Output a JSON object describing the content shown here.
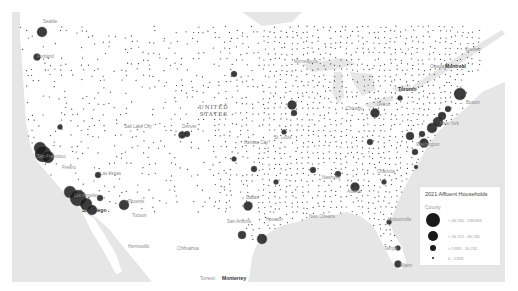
{
  "map": {
    "country_label": [
      "UNITED",
      "STATES"
    ],
    "colors": {
      "water": "#e6e6e6",
      "land": "#ffffff",
      "symbol": "#1a1a1a",
      "dot": "#3a3a3a"
    },
    "labels": [
      {
        "text": "Quebec",
        "x": 453,
        "y": 38,
        "bold": false
      },
      {
        "text": "Ottawa",
        "x": 418,
        "y": 55,
        "bold": false
      },
      {
        "text": "Montreal",
        "x": 433,
        "y": 54,
        "bold": true
      },
      {
        "text": "Toronto",
        "x": 386,
        "y": 77,
        "bold": true
      },
      {
        "text": "Boston",
        "x": 454,
        "y": 91,
        "bold": false
      },
      {
        "text": "New York",
        "x": 428,
        "y": 112,
        "bold": false
      },
      {
        "text": "Washington",
        "x": 404,
        "y": 133,
        "bold": false
      },
      {
        "text": "Chicago",
        "x": 334,
        "y": 97,
        "bold": false
      },
      {
        "text": "Detroit",
        "x": 365,
        "y": 93,
        "bold": false
      },
      {
        "text": "Minneapolis",
        "x": 282,
        "y": 50,
        "bold": false
      },
      {
        "text": "Seattle",
        "x": 31,
        "y": 10,
        "bold": false
      },
      {
        "text": "Portland",
        "x": 25,
        "y": 45,
        "bold": false
      },
      {
        "text": "Salt Lake City",
        "x": 112,
        "y": 115,
        "bold": false
      },
      {
        "text": "Denver",
        "x": 170,
        "y": 115,
        "bold": false
      },
      {
        "text": "San Francisco",
        "x": 25,
        "y": 145,
        "bold": false
      },
      {
        "text": "Fresno",
        "x": 50,
        "y": 156,
        "bold": false
      },
      {
        "text": "Las Vegas",
        "x": 88,
        "y": 162,
        "bold": false
      },
      {
        "text": "Los Angeles",
        "x": 62,
        "y": 184,
        "bold": false
      },
      {
        "text": "San Diego",
        "x": 70,
        "y": 198,
        "bold": true
      },
      {
        "text": "Phoenix",
        "x": 116,
        "y": 190,
        "bold": false
      },
      {
        "text": "Tucson",
        "x": 120,
        "y": 204,
        "bold": false
      },
      {
        "text": "Hermosillo",
        "x": 116,
        "y": 235,
        "bold": false
      },
      {
        "text": "Chihuahua",
        "x": 165,
        "y": 237,
        "bold": false
      },
      {
        "text": "Torreon",
        "x": 188,
        "y": 267,
        "bold": false
      },
      {
        "text": "Monterrey",
        "x": 210,
        "y": 266,
        "bold": true
      },
      {
        "text": "Culiacan",
        "x": 152,
        "y": 276,
        "bold": false
      },
      {
        "text": "Kansas City",
        "x": 232,
        "y": 131,
        "bold": false
      },
      {
        "text": "St. Louis",
        "x": 262,
        "y": 126,
        "bold": false
      },
      {
        "text": "Nashville",
        "x": 310,
        "y": 166,
        "bold": false
      },
      {
        "text": "Atlanta",
        "x": 335,
        "y": 180,
        "bold": false
      },
      {
        "text": "Charlotte",
        "x": 365,
        "y": 160,
        "bold": false
      },
      {
        "text": "Dallas",
        "x": 234,
        "y": 186,
        "bold": false
      },
      {
        "text": "San Antonio",
        "x": 215,
        "y": 210,
        "bold": false
      },
      {
        "text": "Houston",
        "x": 254,
        "y": 208,
        "bold": false
      },
      {
        "text": "New Orleans",
        "x": 297,
        "y": 205,
        "bold": false
      },
      {
        "text": "Jacksonville",
        "x": 375,
        "y": 208,
        "bold": false
      },
      {
        "text": "Tampa",
        "x": 372,
        "y": 237,
        "bold": false
      },
      {
        "text": "Miami",
        "x": 388,
        "y": 254,
        "bold": false
      }
    ],
    "bubbles": [
      {
        "x": 30,
        "y": 20,
        "r": 5
      },
      {
        "x": 25,
        "y": 45,
        "r": 3.5
      },
      {
        "x": 28,
        "y": 136,
        "r": 6
      },
      {
        "x": 31,
        "y": 142,
        "r": 8
      },
      {
        "x": 36,
        "y": 145,
        "r": 6
      },
      {
        "x": 86,
        "y": 163,
        "r": 3
      },
      {
        "x": 58,
        "y": 180,
        "r": 6
      },
      {
        "x": 66,
        "y": 186,
        "r": 8
      },
      {
        "x": 74,
        "y": 192,
        "r": 6
      },
      {
        "x": 80,
        "y": 198,
        "r": 5
      },
      {
        "x": 88,
        "y": 186,
        "r": 3
      },
      {
        "x": 112,
        "y": 193,
        "r": 5
      },
      {
        "x": 48,
        "y": 115,
        "r": 2.5
      },
      {
        "x": 170,
        "y": 123,
        "r": 3.5
      },
      {
        "x": 175,
        "y": 122,
        "r": 3
      },
      {
        "x": 222,
        "y": 62,
        "r": 3
      },
      {
        "x": 222,
        "y": 147,
        "r": 2.5
      },
      {
        "x": 242,
        "y": 157,
        "r": 3
      },
      {
        "x": 236,
        "y": 194,
        "r": 4.5
      },
      {
        "x": 230,
        "y": 223,
        "r": 4
      },
      {
        "x": 250,
        "y": 227,
        "r": 5
      },
      {
        "x": 272,
        "y": 120,
        "r": 2.5
      },
      {
        "x": 264,
        "y": 170,
        "r": 2.5
      },
      {
        "x": 280,
        "y": 93,
        "r": 4.5
      },
      {
        "x": 282,
        "y": 101,
        "r": 3
      },
      {
        "x": 301,
        "y": 158,
        "r": 3
      },
      {
        "x": 326,
        "y": 162,
        "r": 3
      },
      {
        "x": 343,
        "y": 175,
        "r": 4.5
      },
      {
        "x": 358,
        "y": 130,
        "r": 3
      },
      {
        "x": 363,
        "y": 101,
        "r": 4.5
      },
      {
        "x": 388,
        "y": 86,
        "r": 2.5
      },
      {
        "x": 403,
        "y": 140,
        "r": 3
      },
      {
        "x": 404,
        "y": 155,
        "r": 2
      },
      {
        "x": 372,
        "y": 170,
        "r": 2.5
      },
      {
        "x": 410,
        "y": 122,
        "r": 3
      },
      {
        "x": 412,
        "y": 131,
        "r": 4.5
      },
      {
        "x": 398,
        "y": 124,
        "r": 4
      },
      {
        "x": 420,
        "y": 116,
        "r": 5
      },
      {
        "x": 426,
        "y": 110,
        "r": 5
      },
      {
        "x": 430,
        "y": 104,
        "r": 4
      },
      {
        "x": 436,
        "y": 97,
        "r": 3
      },
      {
        "x": 448,
        "y": 82,
        "r": 6
      },
      {
        "x": 377,
        "y": 210,
        "r": 2.5
      },
      {
        "x": 386,
        "y": 236,
        "r": 2.5
      },
      {
        "x": 386,
        "y": 252,
        "r": 3.5
      }
    ]
  },
  "legend": {
    "title": "2021 Affluent Households",
    "subtitle": "County",
    "classes": [
      {
        "label": "> 46,746 - 138,663",
        "size": 14
      },
      {
        "label": "> 16,702 - 46,746",
        "size": 10
      },
      {
        "label": "> 2,835 - 16,702",
        "size": 6
      },
      {
        "label": "0 - 2,835",
        "size": 2
      }
    ]
  }
}
